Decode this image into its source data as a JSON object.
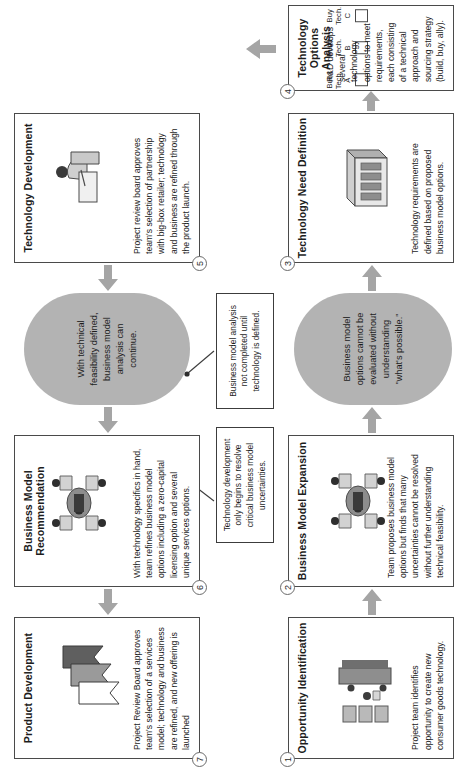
{
  "diagram": {
    "accent_gray": "#b3b3b3",
    "line_color": "#4a4a4a"
  },
  "steps": [
    {
      "number": "1",
      "title": "Opportunity Identification",
      "body": "Project team identifies opportunity to create new consumer goods technology.",
      "icon": "team-meeting-icon"
    },
    {
      "number": "2",
      "title": "Business Model Expansion",
      "body": "Team proposes business model options but finds that many uncertainties cannot be resolved without further understanding technical feasibility.",
      "icon": "team-table-icon"
    },
    {
      "number": "3",
      "title": "Technology Need Definition",
      "body": "Technology requirements are defined based on proposed business model options.",
      "icon": "server-rack-icon"
    },
    {
      "number": "4",
      "title": "Technology Options Analysis",
      "body": "R&D develops several technology options to meet requirements, each consisting of a technical approach and sourcing strategy (build, buy, ally).",
      "icon": "checkbox-options-icon"
    },
    {
      "number": "5",
      "title": "Technology Development",
      "body": "Project review board approves team's selection of partnership with big-box retailer; technology and business are refined through the product launch.",
      "icon": "person-at-desk-icon"
    },
    {
      "number": "6",
      "title": "Business Model Recommendation",
      "body": "With technology specifics in hand, team refines business model options including a zero-capital licensing option and several unique services options.",
      "icon": "team-table-icon"
    },
    {
      "number": "7",
      "title": "Product Development",
      "body": "Project Review Board approves team's selection of a services model; technology and business are refined, and new offering is launched",
      "icon": "stacked-banners-icon"
    }
  ],
  "options": [
    {
      "line1": "Build",
      "line2": "Tech. A"
    },
    {
      "line1": "Build",
      "line2": "Tech. B"
    },
    {
      "line1": "Buy",
      "line2": "Tech. C"
    }
  ],
  "callouts": [
    {
      "id": "pill-1-2",
      "text": "Business model options cannot be evaluated without understanding \"what's possible.\""
    },
    {
      "id": "pill-5-6",
      "text": "With technical feasibility defined, business model analysis can continue."
    }
  ],
  "notes": [
    {
      "id": "note-tech-dev",
      "text": "Technology development only begins to resolve critical business model uncertainties."
    },
    {
      "id": "note-bm-analysis",
      "text": "Business model analysis not completed until technology is defined."
    }
  ]
}
